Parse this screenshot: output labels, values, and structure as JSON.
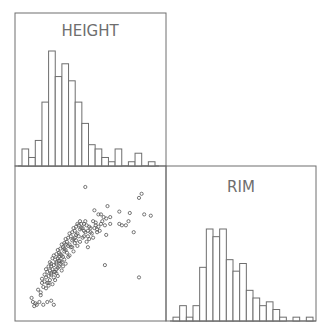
{
  "colors": {
    "stroke": "#6e6e6e",
    "background": "#ffffff",
    "point": "#555555"
  },
  "chart_data": {
    "type": "scatter-matrix",
    "variables": [
      "HEIGHT",
      "RIM"
    ],
    "panels": [
      {
        "position": "top-left",
        "type": "histogram",
        "title": "HEIGHT",
        "bin_counts": [
          4,
          2,
          6,
          15,
          27,
          21,
          24,
          20,
          15,
          10,
          5,
          4,
          2,
          1,
          4,
          0,
          1,
          3,
          0,
          1
        ]
      },
      {
        "position": "bottom-right",
        "type": "histogram",
        "title": "RIM",
        "bin_counts": [
          1,
          4,
          1,
          4,
          14,
          24,
          22,
          24,
          16,
          13,
          15,
          8,
          6,
          4,
          5,
          3,
          1,
          0,
          1,
          0,
          1
        ]
      },
      {
        "position": "bottom-left",
        "type": "scatter",
        "x_variable": "HEIGHT",
        "y_variable": "RIM",
        "marker": "open-circle",
        "points": [
          [
            0.05,
            0.89
          ],
          [
            0.06,
            0.92
          ],
          [
            0.07,
            0.95
          ],
          [
            0.08,
            0.93
          ],
          [
            0.09,
            0.94
          ],
          [
            0.11,
            0.92
          ],
          [
            0.14,
            0.94
          ],
          [
            0.17,
            0.92
          ],
          [
            0.2,
            0.91
          ],
          [
            0.22,
            0.94
          ],
          [
            0.1,
            0.83
          ],
          [
            0.12,
            0.85
          ],
          [
            0.14,
            0.81
          ],
          [
            0.16,
            0.82
          ],
          [
            0.18,
            0.8
          ],
          [
            0.13,
            0.78
          ],
          [
            0.15,
            0.77
          ],
          [
            0.17,
            0.78
          ],
          [
            0.19,
            0.76
          ],
          [
            0.21,
            0.79
          ],
          [
            0.16,
            0.74
          ],
          [
            0.18,
            0.73
          ],
          [
            0.2,
            0.72
          ],
          [
            0.22,
            0.74
          ],
          [
            0.24,
            0.71
          ],
          [
            0.17,
            0.7
          ],
          [
            0.19,
            0.69
          ],
          [
            0.21,
            0.68
          ],
          [
            0.23,
            0.7
          ],
          [
            0.25,
            0.67
          ],
          [
            0.2,
            0.66
          ],
          [
            0.22,
            0.65
          ],
          [
            0.24,
            0.64
          ],
          [
            0.26,
            0.66
          ],
          [
            0.28,
            0.63
          ],
          [
            0.19,
            0.63
          ],
          [
            0.23,
            0.61
          ],
          [
            0.25,
            0.6
          ],
          [
            0.27,
            0.62
          ],
          [
            0.29,
            0.59
          ],
          [
            0.22,
            0.58
          ],
          [
            0.24,
            0.57
          ],
          [
            0.26,
            0.56
          ],
          [
            0.28,
            0.58
          ],
          [
            0.3,
            0.55
          ],
          [
            0.25,
            0.54
          ],
          [
            0.27,
            0.53
          ],
          [
            0.29,
            0.52
          ],
          [
            0.31,
            0.54
          ],
          [
            0.33,
            0.51
          ],
          [
            0.28,
            0.5
          ],
          [
            0.3,
            0.49
          ],
          [
            0.32,
            0.48
          ],
          [
            0.34,
            0.5
          ],
          [
            0.36,
            0.47
          ],
          [
            0.31,
            0.46
          ],
          [
            0.33,
            0.45
          ],
          [
            0.35,
            0.44
          ],
          [
            0.37,
            0.46
          ],
          [
            0.39,
            0.43
          ],
          [
            0.34,
            0.42
          ],
          [
            0.36,
            0.41
          ],
          [
            0.38,
            0.4
          ],
          [
            0.4,
            0.42
          ],
          [
            0.42,
            0.39
          ],
          [
            0.37,
            0.38
          ],
          [
            0.39,
            0.37
          ],
          [
            0.41,
            0.36
          ],
          [
            0.43,
            0.38
          ],
          [
            0.45,
            0.35
          ],
          [
            0.26,
            0.62
          ],
          [
            0.24,
            0.68
          ],
          [
            0.18,
            0.66
          ],
          [
            0.21,
            0.6
          ],
          [
            0.27,
            0.57
          ],
          [
            0.3,
            0.61
          ],
          [
            0.32,
            0.56
          ],
          [
            0.29,
            0.66
          ],
          [
            0.35,
            0.52
          ],
          [
            0.38,
            0.49
          ],
          [
            0.2,
            0.71
          ],
          [
            0.15,
            0.72
          ],
          [
            0.23,
            0.76
          ],
          [
            0.18,
            0.78
          ],
          [
            0.12,
            0.87
          ],
          [
            0.25,
            0.73
          ],
          [
            0.28,
            0.69
          ],
          [
            0.31,
            0.64
          ],
          [
            0.34,
            0.58
          ],
          [
            0.37,
            0.55
          ],
          [
            0.4,
            0.51
          ],
          [
            0.42,
            0.48
          ],
          [
            0.44,
            0.45
          ],
          [
            0.46,
            0.41
          ],
          [
            0.41,
            0.44
          ],
          [
            0.36,
            0.52
          ],
          [
            0.33,
            0.59
          ],
          [
            0.3,
            0.53
          ],
          [
            0.27,
            0.64
          ],
          [
            0.22,
            0.7
          ],
          [
            0.44,
            0.38
          ],
          [
            0.47,
            0.36
          ],
          [
            0.48,
            0.4
          ],
          [
            0.5,
            0.38
          ],
          [
            0.52,
            0.33
          ],
          [
            0.5,
            0.41
          ],
          [
            0.46,
            0.33
          ],
          [
            0.45,
            0.44
          ],
          [
            0.42,
            0.33
          ],
          [
            0.39,
            0.47
          ],
          [
            0.43,
            0.35
          ],
          [
            0.48,
            0.44
          ],
          [
            0.54,
            0.34
          ],
          [
            0.56,
            0.28
          ],
          [
            0.53,
            0.38
          ],
          [
            0.49,
            0.46
          ],
          [
            0.51,
            0.42
          ],
          [
            0.47,
            0.48
          ],
          [
            0.55,
            0.41
          ],
          [
            0.58,
            0.35
          ],
          [
            0.6,
            0.3
          ],
          [
            0.58,
            0.28
          ],
          [
            0.63,
            0.22
          ],
          [
            0.62,
            0.31
          ],
          [
            0.56,
            0.37
          ],
          [
            0.52,
            0.45
          ],
          [
            0.54,
            0.36
          ],
          [
            0.57,
            0.4
          ],
          [
            0.59,
            0.33
          ],
          [
            0.61,
            0.36
          ],
          [
            0.38,
            0.45
          ],
          [
            0.4,
            0.35
          ],
          [
            0.45,
            0.4
          ],
          [
            0.49,
            0.37
          ],
          [
            0.31,
            0.5
          ],
          [
            0.26,
            0.59
          ],
          [
            0.24,
            0.63
          ],
          [
            0.2,
            0.64
          ],
          [
            0.16,
            0.68
          ],
          [
            0.13,
            0.75
          ],
          [
            0.46,
            0.08
          ],
          [
            0.87,
            0.16
          ],
          [
            0.89,
            0.13
          ],
          [
            0.8,
            0.27
          ],
          [
            0.72,
            0.26
          ],
          [
            0.79,
            0.33
          ],
          [
            0.83,
            0.41
          ],
          [
            0.96,
            0.29
          ],
          [
            0.91,
            0.28
          ],
          [
            0.65,
            0.3
          ],
          [
            0.77,
            0.36
          ],
          [
            0.62,
            0.43
          ],
          [
            0.72,
            0.35
          ],
          [
            0.74,
            0.36
          ],
          [
            0.61,
            0.65
          ],
          [
            0.87,
            0.74
          ],
          [
            0.53,
            0.25
          ],
          [
            0.55,
            0.39
          ],
          [
            0.65,
            0.35
          ],
          [
            0.48,
            0.52
          ]
        ]
      }
    ],
    "xlabel": "",
    "ylabel": "",
    "grid": false,
    "legend": "none"
  }
}
